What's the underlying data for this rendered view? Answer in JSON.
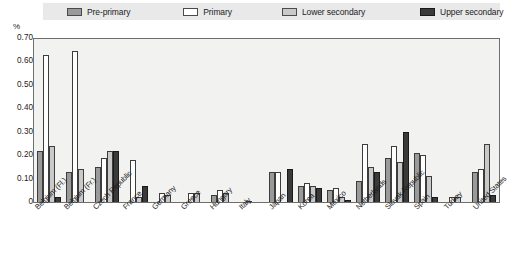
{
  "chart": {
    "unit_label": "%",
    "y_ticks": [
      "0.70",
      "0.60",
      "0.50",
      "0.40",
      "0.30",
      "0.20",
      "0.10",
      "0"
    ]
  },
  "legend": {
    "items": [
      {
        "label": "Pre-primary",
        "color": "#9a9a9a",
        "icon": "legend-swatch-pre-primary"
      },
      {
        "label": "Primary",
        "color": "#ffffff",
        "icon": "legend-swatch-primary"
      },
      {
        "label": "Lower secondary",
        "color": "#c9c9c9",
        "icon": "legend-swatch-lower-secondary"
      },
      {
        "label": "Upper secondary",
        "color": "#3a3a3a",
        "icon": "legend-swatch-upper-secondary"
      }
    ]
  },
  "chart_data": {
    "type": "bar",
    "title": "",
    "xlabel": "",
    "ylabel": "%",
    "ylim": [
      0,
      0.7
    ],
    "ytick_values": [
      0,
      0.1,
      0.2,
      0.3,
      0.4,
      0.5,
      0.6,
      0.7
    ],
    "grid": false,
    "legend_position": "top",
    "categories": [
      "Belgium (Fl.)",
      "Belgium (Fr.)",
      "Czech Republic",
      "France",
      "Germany",
      "Greece",
      "Hungary",
      "Italy",
      "Japan",
      "Korea",
      "Mexico",
      "Netherlands",
      "Slovak Republic",
      "Spain",
      "Turkey",
      "United States"
    ],
    "series": [
      {
        "name": "Pre-primary",
        "color": "#9a9a9a",
        "values": [
          0.22,
          0.13,
          0.15,
          0.0,
          0.0,
          0.0,
          0.03,
          0.0,
          0.13,
          0.07,
          0.05,
          0.09,
          0.19,
          0.21,
          0.0,
          0.13
        ]
      },
      {
        "name": "Primary",
        "color": "#ffffff",
        "values": [
          0.63,
          0.65,
          0.19,
          0.18,
          0.04,
          0.04,
          0.05,
          0.005,
          0.13,
          0.08,
          0.06,
          0.25,
          0.24,
          0.2,
          0.02,
          0.14
        ]
      },
      {
        "name": "Lower secondary",
        "color": "#c9c9c9",
        "values": [
          0.24,
          0.14,
          0.22,
          0.02,
          0.03,
          0.04,
          0.04,
          0.0,
          0.0,
          0.07,
          0.02,
          0.15,
          0.17,
          0.11,
          0.02,
          0.25
        ]
      },
      {
        "name": "Upper secondary",
        "color": "#3a3a3a",
        "values": [
          0.02,
          0.0,
          0.22,
          0.07,
          0.0,
          0.0,
          0.0,
          0.0,
          0.14,
          0.06,
          0.01,
          0.13,
          0.3,
          0.02,
          0.0,
          0.03
        ]
      }
    ]
  }
}
